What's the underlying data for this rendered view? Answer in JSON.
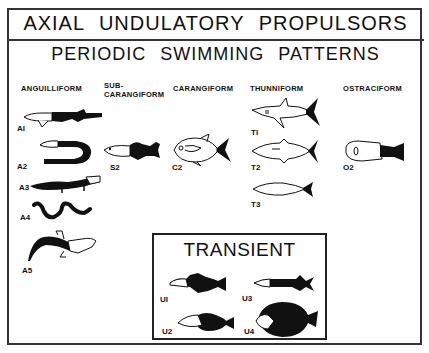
{
  "header": {
    "title": "AXIAL UNDULATORY PROPULSORS",
    "subtitle": "PERIODIC SWIMMING PATTERNS"
  },
  "columns": [
    {
      "id": "anguilliform",
      "label": "ANGUILLIFORM"
    },
    {
      "id": "subcarangiform",
      "label_line1": "SUB-",
      "label_line2": "CARANGIFORM"
    },
    {
      "id": "carangiform",
      "label": "CARANGIFORM"
    },
    {
      "id": "thunniform",
      "label": "THUNNIFORM"
    },
    {
      "id": "ostraciform",
      "label": "OSTRACIFORM"
    }
  ],
  "figures": {
    "A1": "AI",
    "A2": "A2",
    "A3": "A3",
    "A4": "A4",
    "A5": "A5",
    "S2": "S2",
    "C2": "C2",
    "T1": "TI",
    "T2": "T2",
    "T3": "T3",
    "O2": "O2"
  },
  "transient": {
    "title": "TRANSIENT",
    "figures": {
      "U1": "UI",
      "U2": "U2",
      "U3": "U3",
      "U4": "U4"
    }
  },
  "colors": {
    "ink": "#111111",
    "background": "#ffffff",
    "border": "#333333"
  }
}
